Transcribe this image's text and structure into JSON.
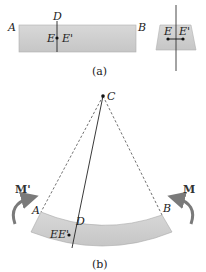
{
  "figure_a": {
    "caption": "(a)",
    "labels": {
      "A": "A",
      "B": "B",
      "D": "D",
      "E": "E",
      "E_prime": "E'"
    },
    "cross_section_labels": {
      "E": "E",
      "E_prime": "E'"
    }
  },
  "figure_b": {
    "caption": "(b)",
    "labels": {
      "C": "C",
      "A": "A",
      "B": "B",
      "D": "D",
      "EE_prime": "EE'",
      "M_prime": "M'",
      "M": "M"
    }
  },
  "colors": {
    "beam_fill": "#cfcfcf",
    "beam_stroke": "#9a9a9a",
    "line": "#222222",
    "arrow": "#7a7a7a"
  }
}
